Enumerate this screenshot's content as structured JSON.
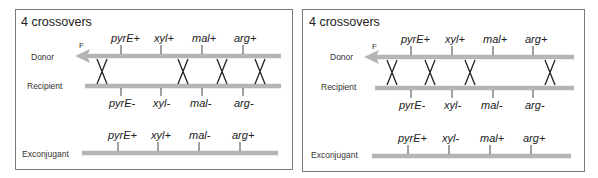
{
  "panels": [
    {
      "title": "4 crossovers",
      "rows": {
        "donor": "Donor",
        "recipient": "Recipient",
        "exconjugant": "Exconjugant"
      },
      "f_label": "F",
      "donor_genes": [
        "pyrE+",
        "xyl+",
        "mal+",
        "arg+"
      ],
      "recipient_genes": [
        "pyrE-",
        "xyl-",
        "mal-",
        "arg-"
      ],
      "exconjugant_genes": [
        "pyrE+",
        "xyl+",
        "mal-",
        "arg+"
      ],
      "crossovers_between": [
        "F-pyrE",
        "xyl-mal",
        "mal-arg",
        "after-arg"
      ]
    },
    {
      "title": "4 crossovers",
      "rows": {
        "donor": "Donor",
        "recipient": "Recipient",
        "exconjugant": "Exconjugant"
      },
      "f_label": "F",
      "donor_genes": [
        "pyrE+",
        "xyl+",
        "mal+",
        "arg+"
      ],
      "recipient_genes": [
        "pyrE-",
        "xyl-",
        "mal-",
        "arg-"
      ],
      "exconjugant_genes": [
        "pyrE+",
        "xyl-",
        "mal+",
        "arg+"
      ],
      "crossovers_between": [
        "F-pyrE",
        "pyrE-xyl",
        "xyl-mal",
        "after-arg"
      ]
    }
  ]
}
